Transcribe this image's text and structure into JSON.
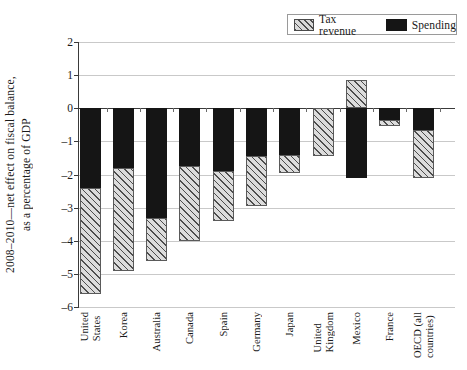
{
  "legend": {
    "items": [
      {
        "label": "Tax revenue",
        "pattern": "hatch",
        "color": "#d9d9d9"
      },
      {
        "label": "Spending",
        "pattern": "solid",
        "color": "#151515"
      }
    ]
  },
  "axis": {
    "ylabel_line1": "2008–2010—net effect on fiscal balance,",
    "ylabel_line2": "as a percentage of GDP",
    "yticks": [
      "2",
      "1",
      "0",
      "–1",
      "–2",
      "–3",
      "–4",
      "–5",
      "–6"
    ]
  },
  "chart_data": {
    "type": "bar",
    "title": "",
    "xlabel": "",
    "ylabel": "2008–2010—net effect on fiscal balance, as a percentage of GDP",
    "ylim": [
      -6,
      2
    ],
    "grid": true,
    "stacked": true,
    "legend_position": "top-right",
    "categories": [
      "United States",
      "Korea",
      "Australia",
      "Canada",
      "Spain",
      "Germany",
      "Japan",
      "United Kingdom",
      "Mexico",
      "France",
      "OECD (all countries)"
    ],
    "category_lines": [
      [
        "United",
        "States"
      ],
      [
        "Korea"
      ],
      [
        "Australia"
      ],
      [
        "Canada"
      ],
      [
        "Spain"
      ],
      [
        "Germany"
      ],
      [
        "Japan"
      ],
      [
        "United",
        "Kingdom"
      ],
      [
        "Mexico"
      ],
      [
        "France"
      ],
      [
        "OECD (all",
        "countries)"
      ]
    ],
    "series": [
      {
        "name": "Spending",
        "values": [
          -2.4,
          -1.8,
          -3.3,
          -1.75,
          -1.9,
          -1.45,
          -1.4,
          0.0,
          -2.1,
          -0.35,
          -0.65
        ]
      },
      {
        "name": "Tax revenue",
        "values": [
          -3.2,
          -3.1,
          -1.3,
          -2.25,
          -1.5,
          -1.5,
          -0.55,
          -1.45,
          0.85,
          -0.2,
          -1.45
        ]
      }
    ],
    "totals": [
      -5.6,
      -4.9,
      -4.6,
      -4.0,
      -3.4,
      -2.95,
      -1.95,
      -1.45,
      -1.25,
      -0.55,
      -2.1
    ]
  }
}
